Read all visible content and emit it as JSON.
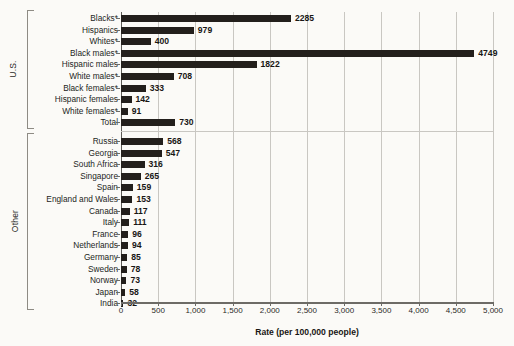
{
  "chart_data": {
    "type": "bar",
    "orientation": "horizontal",
    "title": "",
    "xlabel": "Rate (per 100,000 people)",
    "ylabel": "",
    "xlim": [
      0,
      5000
    ],
    "xticks": [
      0,
      500,
      1000,
      1500,
      2000,
      2500,
      3000,
      3500,
      4000,
      4500,
      5000
    ],
    "xticklabels": [
      "0",
      "500",
      "1,000",
      "1,500",
      "2,000",
      "2,500",
      "3,000",
      "3,500",
      "4,000",
      "4,500",
      "5,000"
    ],
    "grid": "vertical",
    "legend": "none",
    "bar_color": "#231f1c",
    "groups": [
      {
        "name": "U.S.",
        "categories": [
          "Blacks*",
          "Hispanics",
          "Whites*",
          "Black males*",
          "Hispanic males",
          "White males*",
          "Black females*",
          "Hispanic females",
          "White females*",
          "Total"
        ],
        "values": [
          2285,
          979,
          400,
          4749,
          1822,
          708,
          333,
          142,
          91,
          730
        ]
      },
      {
        "name": "Other",
        "categories": [
          "Russia",
          "Georgia",
          "South Africa",
          "Singapore",
          "Spain",
          "England and Wales",
          "Canada",
          "Italy",
          "France",
          "Netherlands",
          "Germany",
          "Sweden",
          "Norway",
          "Japan",
          "India"
        ],
        "values": [
          568,
          547,
          316,
          265,
          159,
          153,
          117,
          111,
          96,
          94,
          85,
          78,
          73,
          58,
          32
        ]
      }
    ]
  }
}
